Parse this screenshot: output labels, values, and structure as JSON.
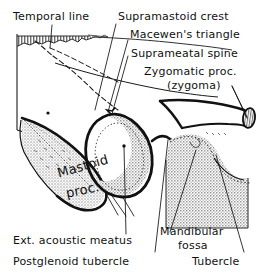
{
  "figure": {
    "type": "anatomical-line-drawing",
    "background_color": "#ffffff",
    "ink_color": "#111111",
    "bone_fill_color": "#b8b8b8",
    "cartilage_fill_color": "#c9c9c9"
  },
  "labels": {
    "temporal_line": "Temporal line",
    "supramastoid_crest": "Supramastoid crest",
    "macewens_triangle": "Macewen's triangle",
    "suprameatal_spine": "Suprameatal spine",
    "zygomatic_process": "Zygomatic proc.",
    "zygoma": "(zygoma)",
    "mastoid_proc_line1": "Mastoid",
    "mastoid_proc_line2": "proc.",
    "ext_acoustic_meatus": "Ext. acoustic meatus",
    "postglenoid_tubercle": "Postglenoid tubercle",
    "mandibular_fossa_line1": "Mandibular",
    "mandibular_fossa_line2": "fossa",
    "tubercle": "Tubercle"
  }
}
